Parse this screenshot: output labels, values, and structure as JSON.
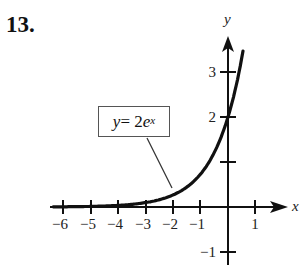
{
  "problem_number": "13.",
  "annotation": {
    "lhs": "y",
    "eq": " = 2",
    "base": "e",
    "exp": "x"
  },
  "axes": {
    "x_label": "x",
    "y_label": "y"
  },
  "colors": {
    "curve": "#111111",
    "axis": "#111111",
    "text": "#222222"
  },
  "chart_data": {
    "type": "line",
    "title": "",
    "function": "y = 2e^x",
    "xlabel": "x",
    "ylabel": "y",
    "xlim": [
      -6.5,
      2.2
    ],
    "ylim": [
      -1.3,
      3.8
    ],
    "x_ticks": [
      -6,
      -5,
      -4,
      -3,
      -2,
      -1,
      1
    ],
    "x_tick_labels": [
      "−6",
      "−5",
      "−4",
      "−3",
      "−2",
      "−1",
      "1"
    ],
    "y_ticks": [
      -1,
      1,
      2,
      3
    ],
    "y_tick_labels": [
      "−1",
      "",
      "2",
      "3"
    ],
    "grid": false,
    "series": [
      {
        "name": "y = 2e^x",
        "x": [
          -6.5,
          -6,
          -5,
          -4,
          -3,
          -2,
          -1,
          0,
          0.5
        ],
        "values": [
          0.003,
          0.005,
          0.013,
          0.037,
          0.1,
          0.271,
          0.736,
          2.0,
          3.297
        ]
      }
    ],
    "annotations": [
      {
        "text": "y = 2e^x",
        "points_to": [
          -2,
          0.27
        ]
      }
    ]
  }
}
